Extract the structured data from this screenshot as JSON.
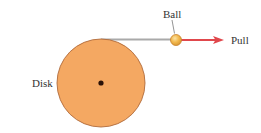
{
  "diagram": {
    "type": "physics-illustration",
    "labels": {
      "disk": "Disk",
      "ball": "Ball",
      "pull": "Pull"
    },
    "colors": {
      "background": "#ffffff",
      "disk_fill": "#f4a862",
      "disk_stroke": "#b06a3a",
      "center_dot": "#2a1208",
      "string": "#a9a9a9",
      "ball_fill": "#f2b84d",
      "ball_stroke": "#c9812c",
      "arrow": "#e0474c",
      "leader_line": "#666666",
      "text": "#333333"
    },
    "disk": {
      "cx": 101,
      "cy": 83,
      "r": 44
    },
    "center_dot": {
      "cx": 101,
      "cy": 83,
      "r": 2.5
    },
    "string": {
      "x1": 101,
      "y1": 39.5,
      "x2": 171,
      "y2": 39.5
    },
    "ball": {
      "cx": 176,
      "cy": 40,
      "r": 5.5
    },
    "arrow": {
      "x1": 181,
      "y1": 40,
      "x2": 224,
      "y2": 40
    },
    "ball_leader": {
      "x1": 172,
      "y1": 20,
      "x2": 174.5,
      "y2": 33.5
    }
  }
}
